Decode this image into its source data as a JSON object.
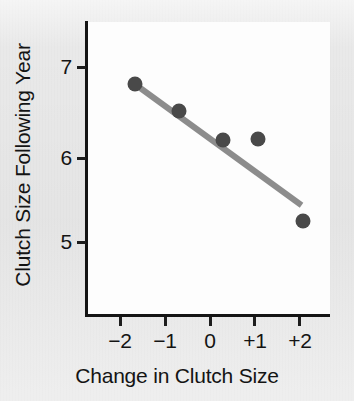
{
  "chart_data": {
    "type": "scatter",
    "title": "",
    "xlabel": "Change in Clutch Size",
    "ylabel": "Clutch Size Following Year",
    "xlim": [
      -2.5,
      2.6
    ],
    "ylim": [
      4.4,
      7.35
    ],
    "xticks": [
      "−2",
      "−1",
      "0",
      "+1",
      "+2"
    ],
    "xtick_values": [
      -2,
      -1,
      0,
      1,
      2
    ],
    "yticks": [
      "7",
      "6",
      "5"
    ],
    "ytick_values": [
      7,
      6,
      5
    ],
    "grid": false,
    "legend": false,
    "x": [
      -1.66,
      -0.68,
      0.32,
      1.1,
      2.11
    ],
    "y": [
      6.81,
      6.5,
      6.17,
      6.18,
      5.24
    ],
    "points": [
      {
        "label": "point-1",
        "x": -1.66,
        "y": 6.81
      },
      {
        "label": "point-2",
        "x": -0.68,
        "y": 6.5
      },
      {
        "label": "point-3",
        "x": 0.32,
        "y": 6.17
      },
      {
        "label": "point-4",
        "x": 1.1,
        "y": 6.18
      },
      {
        "label": "point-5",
        "x": 2.11,
        "y": 5.24
      }
    ],
    "trendline": {
      "type": "line",
      "x": [
        -1.6,
        2.08
      ],
      "y": [
        6.78,
        5.42
      ]
    },
    "colors": {
      "point": "#494949",
      "trendline": "#8c8c8c",
      "axis": "#141414",
      "plot_background": "#fdfdfd",
      "figure_background": "#e9e9e9"
    }
  }
}
